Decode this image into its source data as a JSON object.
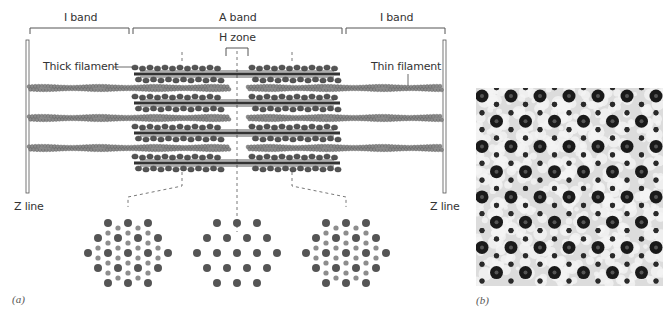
{
  "figure": {
    "panel_a_label": "(a)",
    "panel_b_label": "(b)",
    "labels": {
      "i_band_left": "I band",
      "a_band": "A band",
      "i_band_right": "I band",
      "h_zone": "H zone",
      "thick_filament": "Thick filament",
      "thin_filament": "Thin filament",
      "z_line_left": "Z line",
      "z_line_right": "Z line"
    },
    "thick_filament_count": 4,
    "thin_filament_rows": 3,
    "cross_sections": [
      {
        "name": "overlap-region-left",
        "description": "thick + thin filaments hexagonal lattice"
      },
      {
        "name": "h-zone",
        "description": "thick filaments only"
      },
      {
        "name": "overlap-region-right",
        "description": "thick + thin filaments hexagonal lattice"
      }
    ],
    "colors": {
      "thick_filament": "#555555",
      "thin_filament": "#8a8a8a",
      "line": "#444444"
    }
  }
}
